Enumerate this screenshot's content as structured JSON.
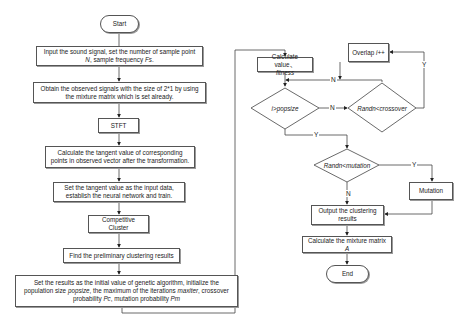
{
  "diagram": {
    "type": "flowchart",
    "nodes": {
      "start": "Start",
      "input_signal": "Input the sound signal, set the number of sample point N, sample frequency Fs.",
      "observed_signals": "Obtain the observed signals with the size of  2*1 by using the mixture matrix which is set already.",
      "stft": "STFT",
      "tangent_calc": "Calculate the tangent value of corresponding points in observed vector after the transformation.",
      "neural_net": "Set the tangent value as the input data, establish the neural network and train.",
      "competitive_cluster": "Competitive Cluster",
      "preliminary": "Find the preliminary clustering results",
      "ga_init": "Set the results as the initial value of genetic algorithm, initialize the population size popsize, the maximum of the iterations maxiter, crossover probability Pc, mutation probability Pm",
      "calc_fitness": "Calculate value, fitness",
      "cond_popsize": "i>popsize",
      "cond_crossover": "Randn<crossover",
      "overlap": "Overlap i++",
      "cond_mutation": "Randn<mutation",
      "mutation": "Mutation",
      "output_results": "Output the clustering results",
      "mixture_matrix": "Calculate the mixture matrix A",
      "end": "End"
    },
    "edge_labels": {
      "popsize_no": "N",
      "popsize_yes": "Y",
      "crossover_yes": "Y",
      "crossover_no": "N",
      "mutation_yes": "Y",
      "mutation_no": "N"
    },
    "text_parts": {
      "input_a": "Input the sound signal, set the number of sample point ",
      "input_N": "N",
      "input_b": ", sample frequency ",
      "input_Fs": "Fs",
      "input_c": ".",
      "ga_a": "Set the results as the initial value of genetic algorithm, initialize the population size ",
      "ga_popsize": "popsize",
      "ga_b": ", the maximum of the iterations ",
      "ga_maxiter": "maxiter",
      "ga_c": ", crossover probability ",
      "ga_Pc": "Pc",
      "ga_d": ", mutation probability ",
      "ga_Pm": "Pm",
      "fit_a": "Calculate value、",
      "fit_b": "fitness",
      "overlap_a": "Overlap ",
      "overlap_b": "i++",
      "mix_a": "Calculate the mixture matrix ",
      "mix_b": "A"
    }
  }
}
